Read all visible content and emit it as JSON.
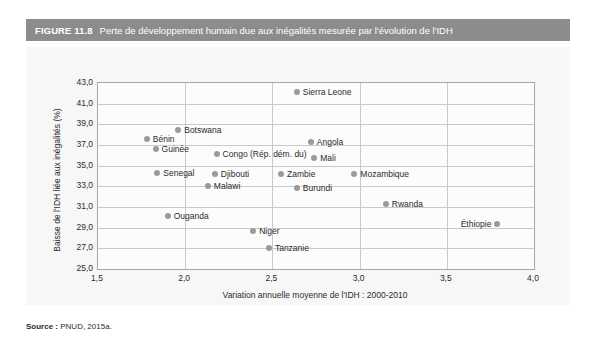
{
  "figure": {
    "number": "FIGURE 11.8",
    "title": "Perte de développement humain due aux inégalités mesurée par l'évolution de l'IDH",
    "source_label": "Source :",
    "source_text": " PNUD, 2015a."
  },
  "chart_data": {
    "type": "scatter",
    "title": "Perte de développement humain due aux inégalités mesurée par l'évolution de l'IDH",
    "xlabel": "Variation annuelle moyenne de l'IDH : 2000-2010",
    "ylabel": "Baisse de l'IDH liée aux inégalités (%)",
    "xlim": [
      1.5,
      4.0
    ],
    "ylim": [
      25.0,
      43.0
    ],
    "xticks": [
      "1,5",
      "2,0",
      "2,5",
      "3,0",
      "3,5",
      "4,0"
    ],
    "xtick_values": [
      1.5,
      2.0,
      2.5,
      3.0,
      3.5,
      4.0
    ],
    "yticks": [
      "25,0",
      "27,0",
      "29,0",
      "31,0",
      "33,0",
      "35,0",
      "37,0",
      "39,0",
      "41,0",
      "43,0"
    ],
    "ytick_values": [
      25.0,
      27.0,
      29.0,
      31.0,
      33.0,
      35.0,
      37.0,
      39.0,
      41.0,
      43.0
    ],
    "grid": true,
    "legend": "none",
    "marker_color": "#9a9a9a",
    "points": [
      {
        "label": "Sierra Leone",
        "x": 2.64,
        "y": 42.1,
        "label_side": "right"
      },
      {
        "label": "Botswana",
        "x": 1.96,
        "y": 38.5,
        "label_side": "right"
      },
      {
        "label": "Bénin",
        "x": 1.78,
        "y": 37.6,
        "label_side": "right"
      },
      {
        "label": "Angola",
        "x": 2.72,
        "y": 37.3,
        "label_side": "right"
      },
      {
        "label": "Guinée",
        "x": 1.83,
        "y": 36.6,
        "label_side": "right"
      },
      {
        "label": "Congo (Rép. dém. du)",
        "x": 2.18,
        "y": 36.1,
        "label_side": "right"
      },
      {
        "label": "Mali",
        "x": 2.74,
        "y": 35.7,
        "label_side": "right"
      },
      {
        "label": "Senegal",
        "x": 1.84,
        "y": 34.3,
        "label_side": "right"
      },
      {
        "label": "Djibouti",
        "x": 2.17,
        "y": 34.2,
        "label_side": "right"
      },
      {
        "label": "Zambie",
        "x": 2.55,
        "y": 34.2,
        "label_side": "right"
      },
      {
        "label": "Mozambique",
        "x": 2.97,
        "y": 34.2,
        "label_side": "right"
      },
      {
        "label": "Malawi",
        "x": 2.13,
        "y": 33.0,
        "label_side": "right"
      },
      {
        "label": "Burundi",
        "x": 2.64,
        "y": 32.8,
        "label_side": "right"
      },
      {
        "label": "Rwanda",
        "x": 3.15,
        "y": 31.3,
        "label_side": "right"
      },
      {
        "label": "Ouganda",
        "x": 1.9,
        "y": 30.1,
        "label_side": "right"
      },
      {
        "label": "Niger",
        "x": 2.39,
        "y": 28.7,
        "label_side": "right"
      },
      {
        "label": "Tanzanie",
        "x": 2.48,
        "y": 27.0,
        "label_side": "right"
      },
      {
        "label": "Éthiopie",
        "x": 3.79,
        "y": 29.4,
        "label_side": "left"
      }
    ]
  }
}
